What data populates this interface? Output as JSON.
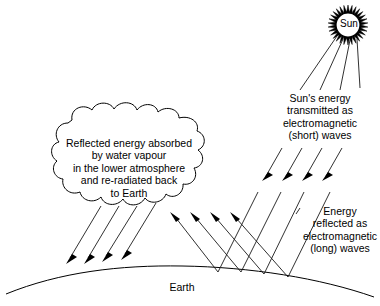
{
  "diagram": {
    "background_color": "#ffffff",
    "line_color": "#000000",
    "sun": {
      "label": "Sun",
      "center_x": 348,
      "center_y": 25,
      "core_radius": 12,
      "spike_count": 30,
      "spike_length": 8
    },
    "labels": {
      "cloud": "Reflected energy absorbed\nby water vapour\nin the lower atmosphere\nand re-radiated back\nto Earth",
      "incoming": "Sun's energy\ntransmitted as\nelectromagnetic\n(short) waves",
      "outgoing": "Energy\nreflected as\nelectromagnetic\n(long) waves",
      "earth": "Earth"
    },
    "arrow_groups": [
      {
        "name": "sun-rays-incoming",
        "direction": "down-left",
        "count": 4,
        "description": "Short-wave solar radiation arriving from the Sun"
      },
      {
        "name": "cloud-reradiated-downward",
        "direction": "down-left",
        "count": 4,
        "description": "Energy re-radiated back to Earth from water vapour"
      },
      {
        "name": "earth-reflected-upward",
        "direction": "up-left",
        "count": 4,
        "description": "Long-wave energy reflected from Earth's surface"
      },
      {
        "name": "incoming-long-lines",
        "direction": "down-left",
        "count": 4,
        "description": "Solar radiation lines continuing down to Earth's surface"
      }
    ],
    "earth": {
      "shape": "arc",
      "description": "Curved surface of the Earth across the bottom"
    },
    "cloud": {
      "shape": "scalloped-cloud",
      "description": "Water vapour cloud in the lower atmosphere"
    }
  }
}
